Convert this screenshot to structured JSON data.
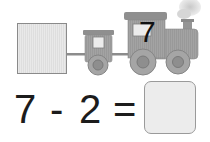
{
  "train": {
    "engine_number": "7",
    "left_box_value": ""
  },
  "equation": {
    "operand1": "7",
    "operator": "-",
    "operand2": "2",
    "equals": "=",
    "answer": ""
  },
  "colors": {
    "train_fill": "#9e9e9e",
    "train_dark": "#7a7a7a",
    "box_fill": "#e6e6e6",
    "text": "#1c1c1c"
  }
}
